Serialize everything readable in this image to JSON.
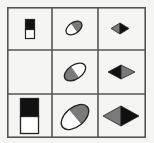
{
  "puzzle": {
    "type": "3x3 matrix reasoning",
    "rows": 3,
    "cols": 3,
    "colors": {
      "background": "#f5f5f3",
      "grid_line": "#555555",
      "black": "#111111",
      "gray": "#7a7a7a",
      "white": "#ffffff",
      "outline": "#222222"
    },
    "cells": [
      {
        "row": 0,
        "col": 0,
        "shape": "rectangle",
        "size": "small",
        "top_fill": "black",
        "bottom_fill": "white"
      },
      {
        "row": 0,
        "col": 1,
        "shape": "tilted-ellipse",
        "size": "small",
        "upper_fill": "gray",
        "lower_fill": "white"
      },
      {
        "row": 0,
        "col": 2,
        "shape": "diamond",
        "size": "small",
        "left_fill": "gray",
        "right_fill": "black"
      },
      {
        "row": 1,
        "col": 0,
        "shape": "empty",
        "size": null
      },
      {
        "row": 1,
        "col": 1,
        "shape": "tilted-ellipse",
        "size": "medium",
        "upper_fill": "white",
        "lower_fill": "gray"
      },
      {
        "row": 1,
        "col": 2,
        "shape": "diamond",
        "size": "medium",
        "left_fill": "black",
        "right_fill": "gray"
      },
      {
        "row": 2,
        "col": 0,
        "shape": "rectangle",
        "size": "large",
        "top_fill": "black",
        "bottom_fill": "white"
      },
      {
        "row": 2,
        "col": 1,
        "shape": "tilted-ellipse",
        "size": "large",
        "upper_fill": "gray",
        "lower_fill": "white"
      },
      {
        "row": 2,
        "col": 2,
        "shape": "diamond",
        "size": "large",
        "left_fill": "gray",
        "right_fill": "black"
      }
    ]
  }
}
